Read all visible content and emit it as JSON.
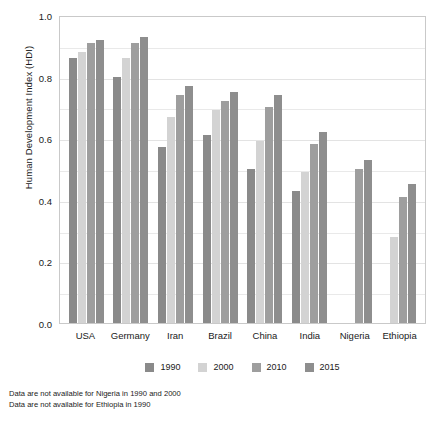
{
  "chart_data": {
    "type": "bar",
    "title": "",
    "xlabel": "",
    "ylabel": "Human Development Index (HDI)",
    "ylim": [
      0.0,
      1.0
    ],
    "ytick_labels": [
      "1.0",
      "0.8",
      "0.6",
      "0.4",
      "0.2",
      "0.0"
    ],
    "ytick_values": [
      1.0,
      0.8,
      0.6,
      0.4,
      0.2,
      0.0
    ],
    "minor_gridlines": [
      0.9,
      0.7,
      0.5,
      0.3,
      0.1
    ],
    "grid": true,
    "legend_position": "bottom",
    "categories": [
      "USA",
      "Germany",
      "Iran",
      "Brazil",
      "China",
      "India",
      "Nigeria",
      "Ethiopia"
    ],
    "series": [
      {
        "name": "1990",
        "color": "#8a8a8a",
        "values": [
          0.86,
          0.8,
          0.57,
          0.61,
          0.5,
          0.43,
          null,
          null
        ]
      },
      {
        "name": "2000",
        "color": "#d3d3d3",
        "values": [
          0.88,
          0.86,
          0.67,
          0.69,
          0.59,
          0.49,
          null,
          0.28
        ]
      },
      {
        "name": "2010",
        "color": "#9e9e9e",
        "values": [
          0.91,
          0.91,
          0.74,
          0.72,
          0.7,
          0.58,
          0.5,
          0.41
        ]
      },
      {
        "name": "2015",
        "color": "#8e8e8e",
        "values": [
          0.92,
          0.93,
          0.77,
          0.75,
          0.74,
          0.62,
          0.53,
          0.45
        ]
      }
    ],
    "annotations": [
      "Data are not available for Nigeria in 1990 and 2000",
      "Data are not available for Ethiopia in 1990"
    ]
  }
}
